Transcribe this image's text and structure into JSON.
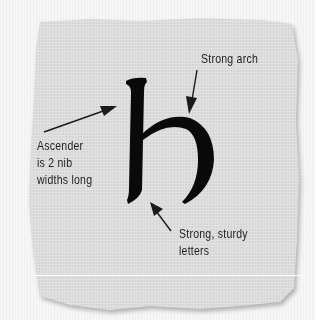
{
  "figure": {
    "glyph": "b",
    "colors": {
      "paper": "#dedede",
      "paper_edge": "#c4c4c4",
      "ink": "#0a0a0a",
      "background": "#f6f6f6"
    }
  },
  "annotations": [
    {
      "id": "strong-arch",
      "lines": [
        "Strong arch"
      ]
    },
    {
      "id": "ascender",
      "lines": [
        "Ascender",
        "is 2 nib",
        "widths long"
      ]
    },
    {
      "id": "sturdy",
      "lines": [
        "Strong, sturdy",
        "letters"
      ]
    }
  ]
}
